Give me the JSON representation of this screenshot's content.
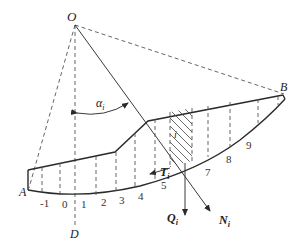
{
  "points": {
    "center": "O",
    "toe": "A",
    "crest": "B",
    "vertical_foot": "D"
  },
  "angle_label": "α",
  "angle_subscript": "i",
  "slice_label": "i",
  "forces": {
    "tangential": {
      "symbol": "T",
      "subscript": "i"
    },
    "weight": {
      "symbol": "Q",
      "subscript": "i"
    },
    "normal": {
      "symbol": "N",
      "subscript": "i"
    }
  },
  "slice_numbers": [
    "-1",
    "0",
    "1",
    "2",
    "3",
    "4",
    "5",
    "7",
    "8",
    "9"
  ]
}
